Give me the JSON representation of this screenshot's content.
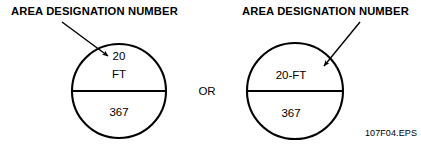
{
  "figure": {
    "id_caption": "107F04.EPS",
    "conjunction": "OR",
    "accent_color": "#000000",
    "background_color": "#ffffff"
  },
  "left_symbol": {
    "callout_label": "AREA DESIGNATION NUMBER",
    "top_line_1": "20",
    "top_line_2": "FT",
    "bottom_line": "367",
    "arrow": {
      "from_x": 62,
      "from_y": 22,
      "to_x": 110,
      "to_y": 58
    },
    "circle": {
      "cx": 119,
      "cy": 91,
      "r": 47
    }
  },
  "right_symbol": {
    "callout_label": "AREA DESIGNATION NUMBER",
    "top_line_1": "20-FT",
    "bottom_line": "367",
    "arrow": {
      "from_x": 360,
      "from_y": 22,
      "to_x": 322,
      "to_y": 68
    },
    "circle": {
      "cx": 295,
      "cy": 91,
      "r": 48
    }
  }
}
